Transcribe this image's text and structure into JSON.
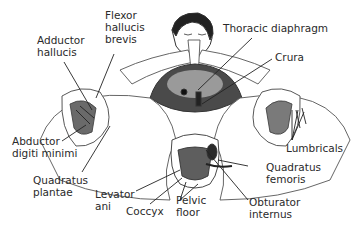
{
  "diagram": {
    "labels": {
      "flexor_hallucis_brevis": "Flexor\nhallucis\nbrevis",
      "adductor_hallucis": "Adductor\nhallucis",
      "thoracic_diaphragm": "Thoracic diaphragm",
      "crura": "Crura",
      "abductor_digiti_minimi": "Abductor\ndigiti minimi",
      "quadratus_plantae": "Quadratus\nplantae",
      "levator_ani": "Levator\nani",
      "coccyx": "Coccyx",
      "pelvic_floor": "Pelvic\nfloor",
      "lumbricals": "Lumbricals",
      "quadratus_femoris": "Quadratus\nfemoris",
      "obturator_internus": "Obturator\ninternus"
    }
  }
}
